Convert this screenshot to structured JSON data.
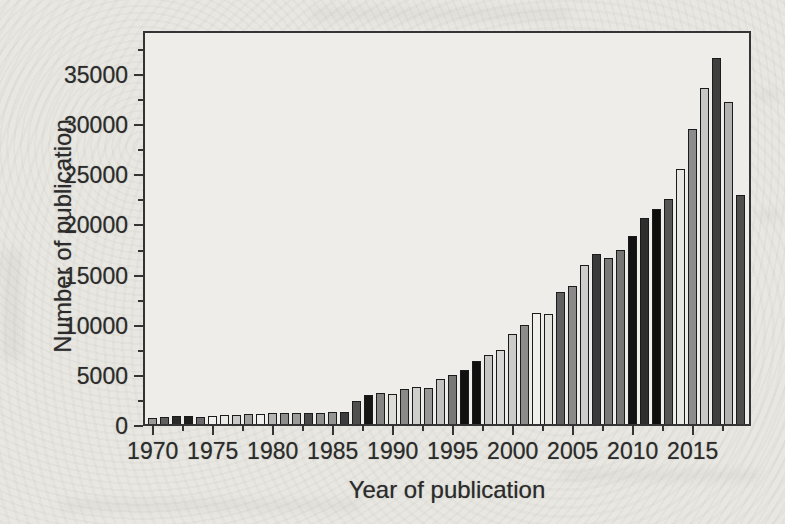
{
  "chart_data": {
    "type": "bar",
    "title": "",
    "xlabel": "Year of publication",
    "ylabel": "Number of publication",
    "x": [
      1970,
      1971,
      1972,
      1973,
      1974,
      1975,
      1976,
      1977,
      1978,
      1979,
      1980,
      1981,
      1982,
      1983,
      1984,
      1985,
      1986,
      1987,
      1988,
      1989,
      1990,
      1991,
      1992,
      1993,
      1994,
      1995,
      1996,
      1997,
      1998,
      1999,
      2000,
      2001,
      2002,
      2003,
      2004,
      2005,
      2006,
      2007,
      2008,
      2009,
      2010,
      2011,
      2012,
      2013,
      2014,
      2015,
      2016,
      2017,
      2018,
      2019
    ],
    "values": [
      600,
      700,
      800,
      800,
      700,
      800,
      900,
      900,
      1000,
      950,
      1050,
      1100,
      1100,
      1050,
      1100,
      1200,
      1200,
      2300,
      2850,
      3100,
      3000,
      3450,
      3700,
      3600,
      4500,
      4900,
      5400,
      6300,
      6900,
      7400,
      9000,
      9900,
      11100,
      11000,
      13200,
      13800,
      15900,
      17000,
      16600,
      17400,
      18800,
      20500,
      21400,
      22400,
      25400,
      29400,
      33500,
      36500,
      32100,
      22800
    ],
    "bar_colors": [
      "#9a9a98",
      "#5f5f5f",
      "#2a2a2a",
      "#1e1e1e",
      "#6b6b6b",
      "#efefec",
      "#e9e9e6",
      "#c9c9c7",
      "#9f9f9d",
      "#eeeeeb",
      "#b5b5b3",
      "#8d8d8b",
      "#9b9b99",
      "#4a4a4a",
      "#8f8f8d",
      "#959593",
      "#3c3c3c",
      "#4f4f4f",
      "#161616",
      "#858583",
      "#dcdcd9",
      "#8a8a88",
      "#cfcfcc",
      "#979795",
      "#c2c2c0",
      "#787876",
      "#111111",
      "#0f0f0f",
      "#c6c6c4",
      "#d8d8d5",
      "#cbcbc9",
      "#8c8c8a",
      "#efefec",
      "#e2e2df",
      "#606060",
      "#8a8a8a",
      "#cdcdcb",
      "#3a3a3a",
      "#7a7a78",
      "#767674",
      "#121212",
      "#2f2f2f",
      "#0d0d0d",
      "#565656",
      "#e8e8e5",
      "#8c8c8c",
      "#c8c8c6",
      "#3f3f3f",
      "#b2b2b0",
      "#4f4f4d"
    ],
    "ylim": [
      0,
      39400
    ],
    "y_major_ticks": [
      0,
      5000,
      10000,
      15000,
      20000,
      25000,
      30000,
      35000
    ],
    "y_minor_ticks": [
      2500,
      7500,
      12500,
      17500,
      22500,
      27500,
      32500,
      37500
    ],
    "x_major_ticks": [
      1970,
      1975,
      1980,
      1985,
      1990,
      1995,
      2000,
      2005,
      2010,
      2015
    ],
    "x_minor_ticks": [
      1972.5,
      1977.5,
      1982.5,
      1987.5,
      1992.5,
      1997.5,
      2002.5,
      2007.5,
      2012.5,
      2017.5
    ],
    "grid": "off",
    "legend": "none",
    "text_color": "#2b2b2b",
    "frame_color": "#343434",
    "bar_edge_color": "#1b1b1b",
    "paper_color": "#e9e7e2"
  }
}
